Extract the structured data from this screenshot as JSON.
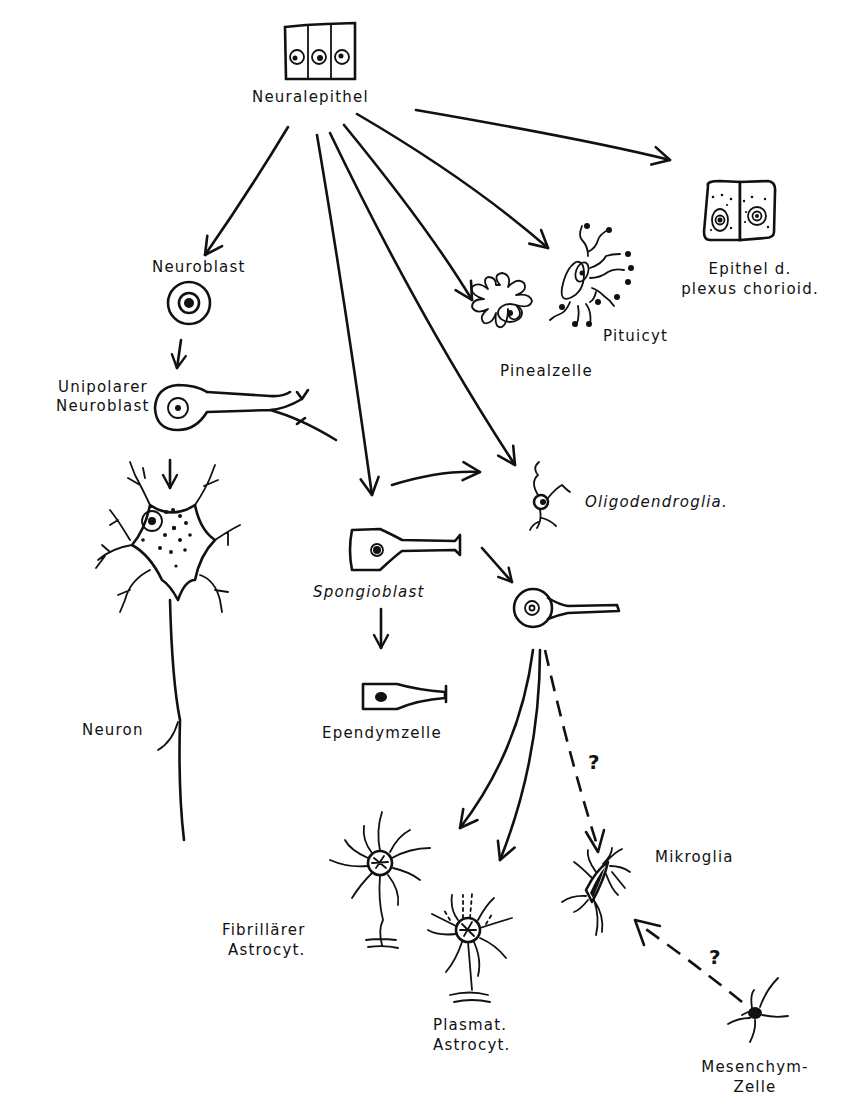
{
  "diagram": {
    "caption": "Abb. ... Die Differenzierung der Zellen des Neuralepithels",
    "colors": {
      "ink": "#111111",
      "background": "#ffffff"
    },
    "nodes": {
      "neuralepithel": {
        "label": "Neuralepithel"
      },
      "neuroblast": {
        "label": "Neuroblast"
      },
      "unipolarer_neuroblast": {
        "line1": "Unipolarer",
        "line2": "Neuroblast"
      },
      "neuron": {
        "label": "Neuron"
      },
      "spongioblast": {
        "label": "Spongioblast"
      },
      "ependymzelle": {
        "label": "Ependymzelle"
      },
      "oligodendroglia": {
        "label": "Oligodendroglia."
      },
      "pinealzelle": {
        "label": "Pinealzelle"
      },
      "pituicyt": {
        "label": "Pituicyt"
      },
      "epithel_plexus": {
        "line1": "Epithel d.",
        "line2": "plexus chorioid."
      },
      "astroblast": {
        "label": ""
      },
      "fibrillaerer_astrocyt": {
        "line1": "Fibrillärer",
        "line2": "Astrocyt."
      },
      "plasmat_astrocyt": {
        "line1": "Plasmat.",
        "line2": "Astrocyt."
      },
      "mikroglia": {
        "label": "Mikroglia"
      },
      "mesenchymzelle": {
        "line1": "Mesenchym-",
        "line2": "Zelle"
      }
    },
    "uncertain_marks": {
      "astroblast_to_mikroglia": "?",
      "mesenchym_to_mikroglia": "?"
    },
    "edges": [
      {
        "from": "Neuralepithel",
        "to": "Neuroblast",
        "style": "solid"
      },
      {
        "from": "Neuralepithel",
        "to": "Spongioblast",
        "style": "solid"
      },
      {
        "from": "Neuralepithel",
        "to": "Oligodendroglia.",
        "style": "solid"
      },
      {
        "from": "Neuralepithel",
        "to": "Pinealzelle",
        "style": "solid"
      },
      {
        "from": "Neuralepithel",
        "to": "Pituicyt",
        "style": "solid"
      },
      {
        "from": "Neuralepithel",
        "to": "Epithel d. plexus chorioid.",
        "style": "solid"
      },
      {
        "from": "Neuroblast",
        "to": "Unipolarer Neuroblast",
        "style": "solid"
      },
      {
        "from": "Unipolarer Neuroblast",
        "to": "Neuron",
        "style": "solid"
      },
      {
        "from": "Spongioblast",
        "to": "Oligodendroglia.",
        "style": "solid"
      },
      {
        "from": "Spongioblast",
        "to": "Ependymzelle",
        "style": "solid"
      },
      {
        "from": "Spongioblast",
        "to": "Astroblast",
        "style": "solid"
      },
      {
        "from": "Astroblast",
        "to": "Fibrillärer Astrocyt.",
        "style": "solid"
      },
      {
        "from": "Astroblast",
        "to": "Plasmat. Astrocyt.",
        "style": "solid"
      },
      {
        "from": "Astroblast",
        "to": "Mikroglia",
        "style": "dashed",
        "mark": "?"
      },
      {
        "from": "Mesenchym-Zelle",
        "to": "Mikroglia",
        "style": "dashed",
        "mark": "?"
      }
    ]
  }
}
